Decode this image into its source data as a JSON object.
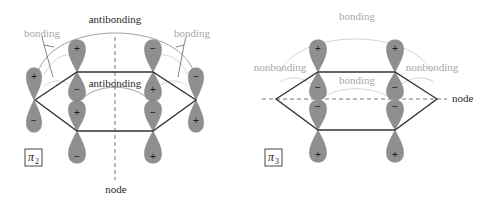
{
  "diagrams": [
    {
      "id": "pi2",
      "label": "π",
      "label_subscript": "2",
      "annotations": {
        "top_arc": "antibonding",
        "inner_arc": "antibonding",
        "left_bonding": "bonding",
        "right_bonding": "bonding",
        "node": "node"
      },
      "orbitals": [
        {
          "position": "left",
          "upper_sign": "+",
          "lower_sign": "−"
        },
        {
          "position": "top-left",
          "upper_sign": "+",
          "lower_sign": "−"
        },
        {
          "position": "bottom-left",
          "upper_sign": "+",
          "lower_sign": "−"
        },
        {
          "position": "top-right",
          "upper_sign": "−",
          "lower_sign": "+"
        },
        {
          "position": "bottom-right",
          "upper_sign": "−",
          "lower_sign": "+"
        },
        {
          "position": "right",
          "upper_sign": "−",
          "lower_sign": "+"
        }
      ],
      "node_orientation": "vertical"
    },
    {
      "id": "pi3",
      "label": "π",
      "label_subscript": "3",
      "annotations": {
        "top_arc": "bonding",
        "inner_arc": "bonding",
        "left_nonbonding": "nonbonding",
        "right_nonbonding": "nonbonding",
        "node": "node"
      },
      "orbitals": [
        {
          "position": "top-left",
          "upper_sign": "+",
          "lower_sign": "−"
        },
        {
          "position": "bottom-left",
          "upper_sign": "−",
          "lower_sign": "+"
        },
        {
          "position": "top-right",
          "upper_sign": "+",
          "lower_sign": "−"
        },
        {
          "position": "bottom-right",
          "upper_sign": "−",
          "lower_sign": "+"
        }
      ],
      "node_orientation": "horizontal"
    }
  ],
  "colors": {
    "lobe": "#8f8f8f",
    "bond": "#333333",
    "dark_label": "#2a2a2a",
    "light_label": "#a8a8a8"
  }
}
